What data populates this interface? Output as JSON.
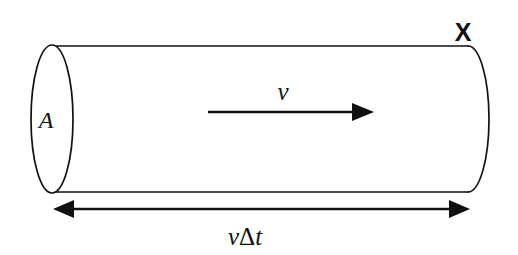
{
  "figure": {
    "background_color": "#ffffff",
    "line_color": "#111111"
  },
  "labels": {
    "area": "A",
    "velocity": "v",
    "surface": "X",
    "length_velocity": "v",
    "length_delta": "Δ",
    "length_time": "t",
    "length_full": "vΔt"
  },
  "geometry": {
    "cylinder": {
      "left_cap_center_x": 52,
      "left_cap_center_y": 119,
      "left_cap_rx": 21,
      "left_cap_ry": 74,
      "right_cap_center_x": 468,
      "right_cap_center_y": 119,
      "right_cap_rx": 21,
      "right_cap_ry": 73,
      "top_edge_y": 46,
      "bottom_edge_y": 192
    },
    "velocity_arrow": {
      "x_start": 208,
      "x_end": 372,
      "y": 112
    },
    "dimension_arrow": {
      "x_start": 55,
      "x_end": 468,
      "y": 209
    }
  }
}
